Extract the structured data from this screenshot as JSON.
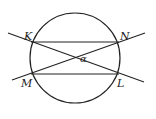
{
  "diagram": {
    "points": {
      "K": {
        "label": "K"
      },
      "N": {
        "label": "N"
      },
      "M": {
        "label": "M"
      },
      "L": {
        "label": "L"
      }
    },
    "angle_label": "α",
    "stroke_color": "#222222"
  }
}
